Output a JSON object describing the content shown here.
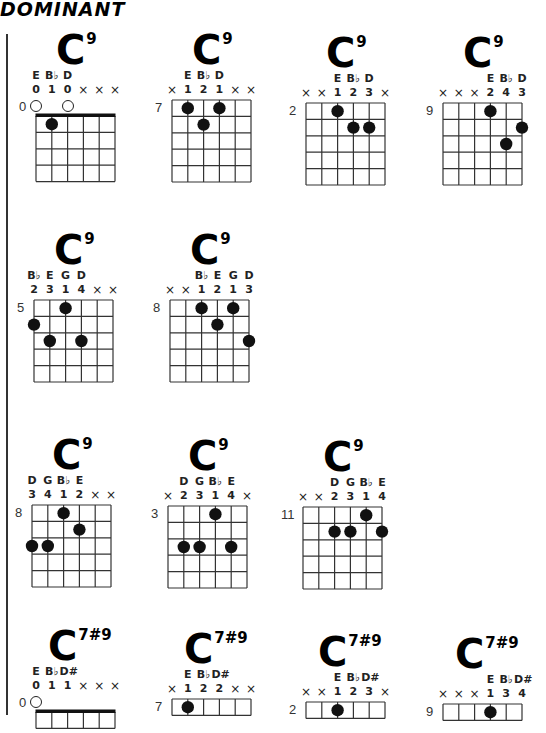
{
  "header": {
    "title": "DOMINANT"
  },
  "chords": [
    {
      "name": "C",
      "ext": "9",
      "fret": "0",
      "nut": true,
      "rows": 4,
      "notes": [
        "E",
        "B♭",
        "D",
        "",
        "",
        ""
      ],
      "fingers": [
        "0",
        "1",
        "0",
        "×",
        "×",
        "×"
      ],
      "open": [
        0,
        2
      ],
      "dots": [
        {
          "s": 1,
          "f": 1
        }
      ]
    },
    {
      "name": "C",
      "ext": "9",
      "fret": "7",
      "nut": false,
      "rows": 5,
      "notes": [
        "",
        "E",
        "B♭",
        "D",
        "",
        ""
      ],
      "fingers": [
        "×",
        "1",
        "2",
        "1",
        "×",
        "×"
      ],
      "open": [],
      "dots": [
        {
          "s": 1,
          "f": 1
        },
        {
          "s": 2,
          "f": 2
        },
        {
          "s": 3,
          "f": 1
        }
      ]
    },
    {
      "name": "C",
      "ext": "9",
      "fret": "2",
      "nut": false,
      "rows": 5,
      "notes": [
        "",
        "",
        "E",
        "B♭",
        "D",
        ""
      ],
      "fingers": [
        "×",
        "×",
        "1",
        "2",
        "3",
        "×"
      ],
      "open": [],
      "dots": [
        {
          "s": 2,
          "f": 1
        },
        {
          "s": 3,
          "f": 2
        },
        {
          "s": 4,
          "f": 2
        }
      ]
    },
    {
      "name": "C",
      "ext": "9",
      "fret": "9",
      "nut": false,
      "rows": 5,
      "notes": [
        "",
        "",
        "",
        "E",
        "B♭",
        "D"
      ],
      "fingers": [
        "×",
        "×",
        "×",
        "2",
        "4",
        "3"
      ],
      "open": [],
      "dots": [
        {
          "s": 3,
          "f": 1
        },
        {
          "s": 5,
          "f": 2
        },
        {
          "s": 4,
          "f": 3
        }
      ]
    },
    {
      "name": "C",
      "ext": "9",
      "fret": "5",
      "nut": false,
      "rows": 5,
      "notes": [
        "B♭",
        "E",
        "G",
        "D",
        "",
        ""
      ],
      "fingers": [
        "2",
        "3",
        "1",
        "4",
        "×",
        "×"
      ],
      "open": [],
      "dots": [
        {
          "s": 2,
          "f": 1
        },
        {
          "s": 0,
          "f": 2
        },
        {
          "s": 1,
          "f": 3
        },
        {
          "s": 3,
          "f": 3
        }
      ]
    },
    {
      "name": "C",
      "ext": "9",
      "fret": "8",
      "nut": false,
      "rows": 5,
      "notes": [
        "",
        "",
        "B♭",
        "E",
        "G",
        "D"
      ],
      "fingers": [
        "×",
        "×",
        "1",
        "2",
        "1",
        "3"
      ],
      "open": [],
      "dots": [
        {
          "s": 2,
          "f": 1
        },
        {
          "s": 4,
          "f": 1
        },
        {
          "s": 3,
          "f": 2
        },
        {
          "s": 5,
          "f": 3
        }
      ]
    },
    {
      "name": "C",
      "ext": "9",
      "fret": "8",
      "nut": false,
      "rows": 5,
      "notes": [
        "D",
        "G",
        "B♭",
        "E",
        "",
        ""
      ],
      "fingers": [
        "3",
        "4",
        "1",
        "2",
        "×",
        "×"
      ],
      "open": [],
      "dots": [
        {
          "s": 2,
          "f": 1
        },
        {
          "s": 3,
          "f": 2
        },
        {
          "s": 0,
          "f": 3
        },
        {
          "s": 1,
          "f": 3
        }
      ]
    },
    {
      "name": "C",
      "ext": "9",
      "fret": "3",
      "nut": false,
      "rows": 5,
      "notes": [
        "",
        "D",
        "G",
        "B♭",
        "E",
        ""
      ],
      "fingers": [
        "×",
        "2",
        "3",
        "1",
        "4",
        "×"
      ],
      "open": [],
      "dots": [
        {
          "s": 3,
          "f": 1
        },
        {
          "s": 1,
          "f": 3
        },
        {
          "s": 2,
          "f": 3
        },
        {
          "s": 4,
          "f": 3
        }
      ]
    },
    {
      "name": "C",
      "ext": "9",
      "fret": "11",
      "nut": false,
      "rows": 5,
      "notes": [
        "",
        "",
        "D",
        "G",
        "B♭",
        "E"
      ],
      "fingers": [
        "×",
        "×",
        "2",
        "3",
        "1",
        "4"
      ],
      "open": [],
      "dots": [
        {
          "s": 4,
          "f": 1
        },
        {
          "s": 2,
          "f": 2
        },
        {
          "s": 3,
          "f": 2
        },
        {
          "s": 5,
          "f": 2
        }
      ]
    },
    {
      "name": "C",
      "ext": "7#9",
      "fret": "0",
      "nut": true,
      "rows": 1,
      "notes": [
        "E",
        "B♭",
        "D#",
        "",
        "",
        ""
      ],
      "fingers": [
        "0",
        "1",
        "1",
        "×",
        "×",
        "×"
      ],
      "open": [
        0
      ],
      "dots": []
    },
    {
      "name": "C",
      "ext": "7#9",
      "fret": "7",
      "nut": false,
      "rows": 1,
      "notes": [
        "",
        "E",
        "B♭",
        "D#",
        "",
        ""
      ],
      "fingers": [
        "×",
        "1",
        "2",
        "2",
        "×",
        "×"
      ],
      "open": [],
      "dots": [
        {
          "s": 1,
          "f": 1
        }
      ]
    },
    {
      "name": "C",
      "ext": "7#9",
      "fret": "2",
      "nut": false,
      "rows": 1,
      "notes": [
        "",
        "",
        "E",
        "B♭",
        "D#",
        ""
      ],
      "fingers": [
        "×",
        "×",
        "1",
        "2",
        "3",
        "×"
      ],
      "open": [],
      "dots": [
        {
          "s": 2,
          "f": 1
        }
      ]
    },
    {
      "name": "C",
      "ext": "7#9",
      "fret": "9",
      "nut": false,
      "rows": 1,
      "notes": [
        "",
        "",
        "",
        "E",
        "B♭",
        "D#"
      ],
      "fingers": [
        "×",
        "×",
        "×",
        "1",
        "3",
        "4"
      ],
      "open": [],
      "dots": [
        {
          "s": 3,
          "f": 1
        }
      ]
    }
  ]
}
